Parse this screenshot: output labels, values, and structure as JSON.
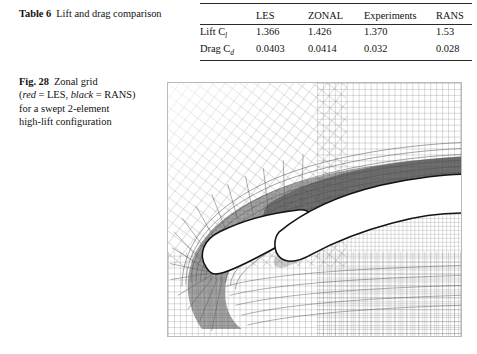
{
  "table_caption": {
    "label": "Table 6",
    "text": "Lift and drag comparison"
  },
  "table": {
    "columns": [
      "",
      "LES",
      "ZONAL",
      "Experiments",
      "RANS"
    ],
    "rows": [
      {
        "label_main": "Lift C",
        "label_sub": "l",
        "values": [
          "1.366",
          "1.426",
          "1.370",
          "1.53"
        ]
      },
      {
        "label_main": "Drag C",
        "label_sub": "d",
        "values": [
          "0.0403",
          "0.0414",
          "0.032",
          "0.028"
        ]
      }
    ]
  },
  "figure_caption": {
    "label": "Fig. 28",
    "line1_a": "Zonal grid",
    "legend_open": "(",
    "legend_red": "red",
    "legend_red_eq": " = LES, ",
    "legend_black": "black",
    "legend_black_eq": " = RANS)",
    "line3": "for a swept 2-element",
    "line4": "high-lift configuration"
  },
  "figure": {
    "alt": "Zonal computational grid around a swept 2-element high-lift airfoil configuration: slat and main element with C-mesh and refined LES zone",
    "grid_color": "#5d5d5d",
    "zone_color": "#5a5a5a",
    "body_color": "#ffffff",
    "outline_color": "#141414"
  }
}
